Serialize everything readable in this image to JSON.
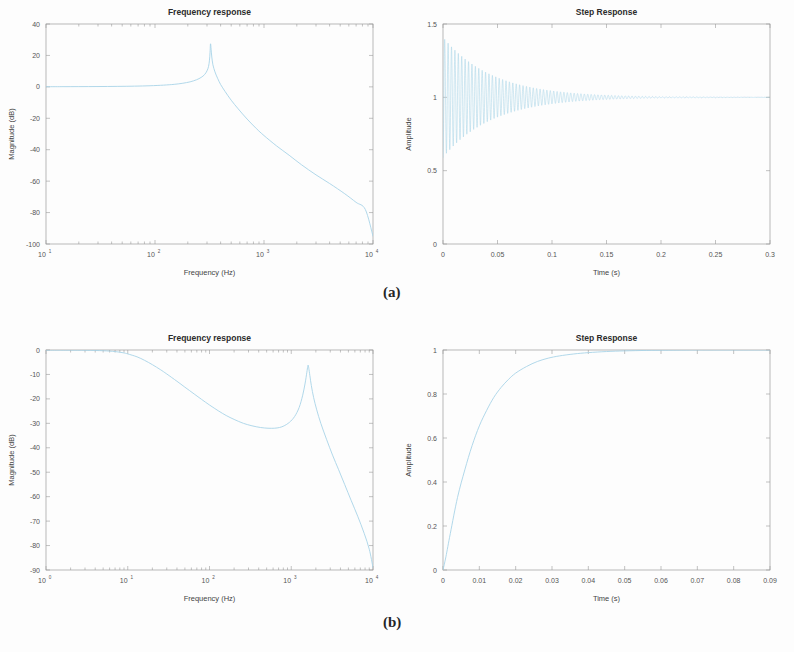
{
  "figure": {
    "panel_labels": [
      {
        "text": "(a)",
        "x": 383,
        "y": 292
      },
      {
        "text": "(b)",
        "x": 383,
        "y": 622
      }
    ],
    "curve_color": "#a8d4e8",
    "axis_color": "#9a9a9a"
  },
  "chart_data": [
    {
      "id": "freq-response-a",
      "type": "line",
      "title": "Frequency response",
      "xlabel": "Frequency  (Hz)",
      "ylabel": "Magnitude (dB)",
      "xscale": "log",
      "xlim": [
        10,
        10000
      ],
      "ylim": [
        -100,
        40
      ],
      "xticks": [
        10,
        100,
        1000,
        10000
      ],
      "xticklabels": [
        "10^1",
        "10^2",
        "10^3",
        "10^4"
      ],
      "yticks": [
        -100,
        -80,
        -60,
        -40,
        -20,
        0,
        20,
        40
      ],
      "yticklabels": [
        "-100",
        "-80",
        "-60",
        "-40",
        "-20",
        "0",
        "20",
        "40"
      ],
      "grid": false,
      "legend": null,
      "annotation": "Second-order resonant lowpass: flat 0 dB passband, resonance peak ~27 dB near 320 Hz, then -40 dB/decade rolloff to -95 dB at 10 kHz",
      "series": [
        {
          "name": "magnitude",
          "points": [
            [
              10,
              0.1
            ],
            [
              14,
              0.12
            ],
            [
              20,
              0.15
            ],
            [
              30,
              0.2
            ],
            [
              45,
              0.3
            ],
            [
              65,
              0.45
            ],
            [
              90,
              0.7
            ],
            [
              120,
              1.1
            ],
            [
              150,
              1.6
            ],
            [
              180,
              2.3
            ],
            [
              210,
              3.2
            ],
            [
              240,
              4.5
            ],
            [
              265,
              6.0
            ],
            [
              285,
              7.8
            ],
            [
              300,
              10.2
            ],
            [
              310,
              13.0
            ],
            [
              316,
              17.0
            ],
            [
              320,
              22.0
            ],
            [
              322,
              26.5
            ],
            [
              324,
              27.2
            ],
            [
              327,
              24.0
            ],
            [
              332,
              19.0
            ],
            [
              340,
              14.0
            ],
            [
              355,
              9.5
            ],
            [
              375,
              5.5
            ],
            [
              400,
              1.5
            ],
            [
              440,
              -3.0
            ],
            [
              500,
              -8.5
            ],
            [
              580,
              -14.0
            ],
            [
              700,
              -20.5
            ],
            [
              850,
              -26.5
            ],
            [
              1000,
              -31.0
            ],
            [
              1300,
              -37.5
            ],
            [
              1700,
              -43.5
            ],
            [
              2200,
              -49.5
            ],
            [
              3000,
              -56.0
            ],
            [
              4000,
              -61.5
            ],
            [
              5500,
              -68.0
            ],
            [
              7000,
              -73.5
            ],
            [
              8500,
              -78.0
            ],
            [
              10000,
              -95.0
            ]
          ]
        }
      ]
    },
    {
      "id": "step-response-a",
      "type": "line",
      "title": "Step Response",
      "xlabel": "Time (s)",
      "ylabel": "Amplitude",
      "xscale": "linear",
      "xlim": [
        0,
        0.3
      ],
      "ylim": [
        0,
        1.5
      ],
      "xticks": [
        0,
        0.05,
        0.1,
        0.15,
        0.2,
        0.25,
        0.3
      ],
      "xticklabels": [
        "0",
        "0.05",
        "0.1",
        "0.15",
        "0.2",
        "0.25",
        "0.3"
      ],
      "yticks": [
        0,
        0.5,
        1,
        1.5
      ],
      "yticklabels": [
        "0",
        "0.5",
        "1",
        "1.5"
      ],
      "grid": false,
      "legend": null,
      "annotation": "Lightly damped oscillation about 1.0, initial envelope 0.52 to 1.41, ringing frequency ~320 Hz, settles to 1.0 by 0.2 s",
      "oscillation": {
        "final_value": 1.0,
        "ring_freq_hz": 320,
        "decay_tau_s": 0.045,
        "initial_overshoot": 0.41,
        "t_start": 0.0,
        "t_end": 0.3
      }
    },
    {
      "id": "freq-response-b",
      "type": "line",
      "title": "Frequency response",
      "xlabel": "Frequency  (Hz)",
      "ylabel": "Magnitude (dB)",
      "xscale": "log",
      "xlim": [
        1,
        10000
      ],
      "ylim": [
        -90,
        0
      ],
      "xticks": [
        1,
        10,
        100,
        1000,
        10000
      ],
      "xticklabels": [
        "10^0",
        "10^1",
        "10^2",
        "10^3",
        "10^4"
      ],
      "yticks": [
        -90,
        -80,
        -70,
        -60,
        -50,
        -40,
        -30,
        -20,
        -10,
        0
      ],
      "yticklabels": [
        "-90",
        "-80",
        "-70",
        "-60",
        "-50",
        "-40",
        "-30",
        "-20",
        "-10",
        "0"
      ],
      "grid": false,
      "legend": false,
      "annotation": "Lowpass rolloff from 0 dB, dips to -32 dB near 800 Hz, resonant peak -6 dB near 1600 Hz, then steep decay to -89 dB at 10 kHz",
      "series": [
        {
          "name": "magnitude",
          "points": [
            [
              1,
              -0.05
            ],
            [
              1.5,
              -0.06
            ],
            [
              2,
              -0.08
            ],
            [
              3,
              -0.12
            ],
            [
              4,
              -0.2
            ],
            [
              5,
              -0.3
            ],
            [
              6,
              -0.45
            ],
            [
              7,
              -0.65
            ],
            [
              8,
              -0.9
            ],
            [
              9,
              -1.2
            ],
            [
              10,
              -1.6
            ],
            [
              13,
              -2.8
            ],
            [
              16,
              -4.2
            ],
            [
              20,
              -6.0
            ],
            [
              25,
              -8.0
            ],
            [
              30,
              -9.8
            ],
            [
              40,
              -12.8
            ],
            [
              50,
              -15.2
            ],
            [
              65,
              -18.0
            ],
            [
              80,
              -20.2
            ],
            [
              100,
              -22.5
            ],
            [
              130,
              -25.0
            ],
            [
              160,
              -26.8
            ],
            [
              200,
              -28.4
            ],
            [
              260,
              -30.0
            ],
            [
              330,
              -31.0
            ],
            [
              420,
              -31.7
            ],
            [
              520,
              -32.0
            ],
            [
              620,
              -32.0
            ],
            [
              720,
              -31.7
            ],
            [
              820,
              -31.0
            ],
            [
              950,
              -29.6
            ],
            [
              1100,
              -27.2
            ],
            [
              1250,
              -23.5
            ],
            [
              1380,
              -18.5
            ],
            [
              1480,
              -13.5
            ],
            [
              1550,
              -9.2
            ],
            [
              1590,
              -6.8
            ],
            [
              1610,
              -6.2
            ],
            [
              1640,
              -7.5
            ],
            [
              1690,
              -10.5
            ],
            [
              1760,
              -14.5
            ],
            [
              1880,
              -19.5
            ],
            [
              2050,
              -24.5
            ],
            [
              2300,
              -30.0
            ],
            [
              2700,
              -36.5
            ],
            [
              3200,
              -43.0
            ],
            [
              3800,
              -49.0
            ],
            [
              4500,
              -55.0
            ],
            [
              5400,
              -61.5
            ],
            [
              6500,
              -68.0
            ],
            [
              7800,
              -75.0
            ],
            [
              9000,
              -81.5
            ],
            [
              10000,
              -89.0
            ]
          ]
        }
      ]
    },
    {
      "id": "step-response-b",
      "type": "line",
      "title": "Step Response",
      "xlabel": "Time (s)",
      "ylabel": "Amplitude",
      "xscale": "linear",
      "xlim": [
        0,
        0.09
      ],
      "ylim": [
        0,
        1
      ],
      "xticks": [
        0,
        0.01,
        0.02,
        0.03,
        0.04,
        0.05,
        0.06,
        0.07,
        0.08,
        0.09
      ],
      "xticklabels": [
        "0",
        "0.01",
        "0.02",
        "0.03",
        "0.04",
        "0.05",
        "0.06",
        "0.07",
        "0.08",
        "0.09"
      ],
      "yticks": [
        0,
        0.2,
        0.4,
        0.6,
        0.8,
        1
      ],
      "yticklabels": [
        "0",
        "0.2",
        "0.4",
        "0.6",
        "0.8",
        "1"
      ],
      "grid": false,
      "legend": null,
      "annotation": "Overdamped first-order-like rise, no overshoot, reaches 0.63 at ~0.009 s and settles at 1.0 by 0.06 s",
      "series": [
        {
          "name": "amplitude",
          "points": [
            [
              0,
              0.0
            ],
            [
              0.0008,
              0.06
            ],
            [
              0.002,
              0.165
            ],
            [
              0.004,
              0.33
            ],
            [
              0.006,
              0.455
            ],
            [
              0.008,
              0.565
            ],
            [
              0.01,
              0.655
            ],
            [
              0.012,
              0.725
            ],
            [
              0.014,
              0.785
            ],
            [
              0.016,
              0.83
            ],
            [
              0.018,
              0.866
            ],
            [
              0.02,
              0.895
            ],
            [
              0.023,
              0.925
            ],
            [
              0.026,
              0.948
            ],
            [
              0.029,
              0.963
            ],
            [
              0.032,
              0.973
            ],
            [
              0.036,
              0.982
            ],
            [
              0.04,
              0.988
            ],
            [
              0.045,
              0.993
            ],
            [
              0.05,
              0.996
            ],
            [
              0.056,
              0.998
            ],
            [
              0.062,
              0.999
            ],
            [
              0.07,
              1.0
            ],
            [
              0.08,
              1.0
            ],
            [
              0.09,
              1.0
            ]
          ]
        }
      ]
    }
  ],
  "panels": [
    {
      "id": "freq-response-a",
      "left": 0,
      "top": 0,
      "w": 397,
      "h": 300
    },
    {
      "id": "step-response-a",
      "left": 397,
      "top": 0,
      "w": 397,
      "h": 300
    },
    {
      "id": "freq-response-b",
      "left": 0,
      "top": 326,
      "w": 397,
      "h": 300
    },
    {
      "id": "step-response-b",
      "left": 397,
      "top": 326,
      "w": 397,
      "h": 300
    }
  ]
}
